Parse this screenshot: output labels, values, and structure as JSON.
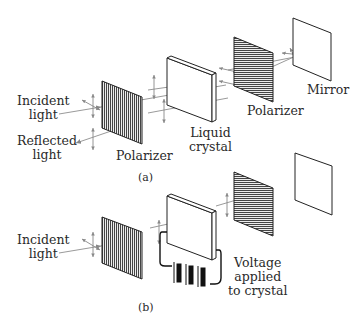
{
  "figure": {
    "panel_a": {
      "caption": "(a)",
      "labels": {
        "incident_light": "Incident\nlight",
        "reflected_light": "Reflected\nlight",
        "polarizer_front": "Polarizer",
        "liquid_crystal": "Liquid\ncrystal",
        "polarizer_back": "Polarizer",
        "mirror": "Mirror"
      }
    },
    "panel_b": {
      "caption": "(b)",
      "labels": {
        "incident_light": "Incident\nlight",
        "voltage": "Voltage\napplied\nto crystal"
      }
    },
    "colors": {
      "line": "#1a1a1a",
      "polarizer_fill": "#555555",
      "ray": "#9a9a9a",
      "background": "#ffffff"
    }
  }
}
